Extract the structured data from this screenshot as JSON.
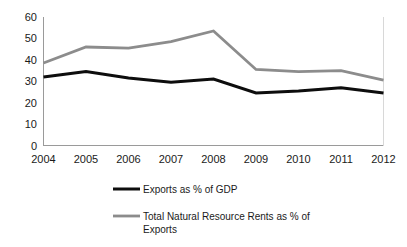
{
  "chart_data": {
    "type": "line",
    "title": "",
    "subtitle": "",
    "xlabel": "",
    "ylabel": "",
    "categories": [
      "2004",
      "2005",
      "2006",
      "2007",
      "2008",
      "2009",
      "2010",
      "2011",
      "2012"
    ],
    "x": [
      2004,
      2005,
      2006,
      2007,
      2008,
      2009,
      2010,
      2011,
      2012
    ],
    "ylim": [
      0,
      60
    ],
    "yticks": [
      "0",
      "10",
      "20",
      "30",
      "40",
      "50",
      "60"
    ],
    "ytick_values": [
      0,
      10,
      20,
      30,
      40,
      50,
      60
    ],
    "grid": false,
    "legend_position": "bottom",
    "series": [
      {
        "name": "Exports as % of GDP",
        "color": "#0d0d0d",
        "values": [
          32,
          34.5,
          31.5,
          29.5,
          31,
          24.5,
          25.5,
          27,
          24.5
        ]
      },
      {
        "name": "Total Natural Resource Rents as % of Exports",
        "color": "#8c8c8c",
        "values": [
          38.5,
          46,
          45.5,
          48.5,
          53.5,
          35.5,
          34.5,
          35,
          30.5
        ]
      }
    ]
  },
  "legend": {
    "entries": [
      {
        "label": "Exports as % of GDP",
        "color": "#0d0d0d"
      },
      {
        "label": "Total Natural Resource Rents as % of",
        "label_line2": "Exports",
        "color": "#8c8c8c"
      }
    ]
  },
  "axes": {
    "y_axis_name": "y-axis",
    "x_axis_name": "x-axis"
  }
}
